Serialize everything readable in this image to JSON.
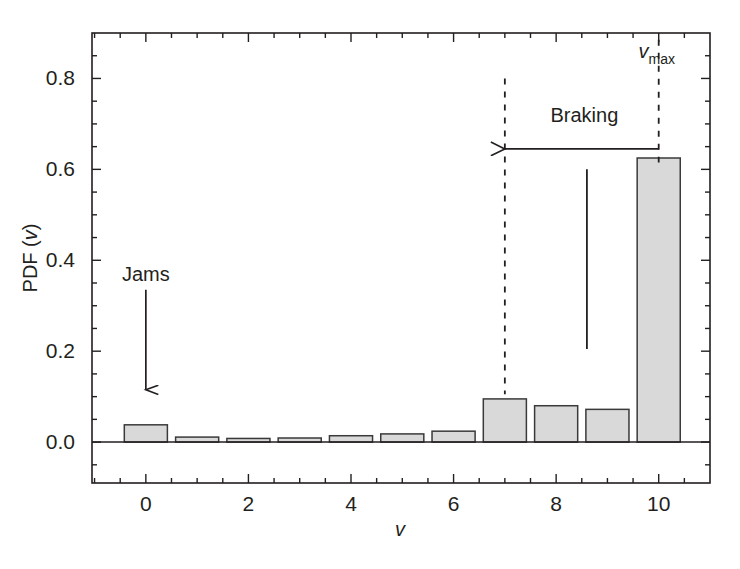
{
  "chart_data": {
    "type": "bar",
    "title": "",
    "subtitle": "",
    "xlabel": "v",
    "ylabel": "PDF (v)",
    "categories": [
      0,
      1,
      2,
      3,
      4,
      5,
      6,
      7,
      8,
      9,
      10
    ],
    "values": [
      0.038,
      0.011,
      0.008,
      0.009,
      0.014,
      0.018,
      0.024,
      0.095,
      0.08,
      0.072,
      0.625
    ],
    "series": [
      {
        "name": "PDF (v)",
        "values": [
          0.038,
          0.011,
          0.008,
          0.009,
          0.014,
          0.018,
          0.024,
          0.095,
          0.08,
          0.072,
          0.625
        ]
      }
    ],
    "xlim": [
      -1.05,
      11.0
    ],
    "ylim": [
      -0.09,
      0.9
    ],
    "xticks": [
      0,
      2,
      4,
      6,
      8,
      10
    ],
    "xtick_labels": [
      "0",
      "2",
      "4",
      "6",
      "8",
      "10"
    ],
    "xminor_step": 0.5,
    "yticks": [
      0.0,
      0.2,
      0.4,
      0.6,
      0.8
    ],
    "ytick_labels": [
      "0.0",
      "0.2",
      "0.4",
      "0.6",
      "0.8"
    ],
    "yminor_step": 0.05,
    "grid": false,
    "legend": "none",
    "bar_fill": "#d9d9d9",
    "bar_edge": "#3a3a3a",
    "bar_width": 0.84,
    "axis_color": "#231f20",
    "annotations": [
      {
        "name": "jams",
        "label": "Jams",
        "label_x": 0.0,
        "label_y": 0.355,
        "arrow_from": {
          "x": 0.0,
          "y": 0.335
        },
        "arrow_to": {
          "x": 0.0,
          "y": 0.115
        },
        "style": "solid-arrow-down"
      },
      {
        "name": "braking",
        "label": "Braking",
        "label_x": 8.55,
        "label_y": 0.705,
        "arrow_from": {
          "x": 10.0,
          "y": 0.645
        },
        "arrow_to": {
          "x": 7.0,
          "y": 0.645
        },
        "style": "solid-arrow-left"
      },
      {
        "name": "vmax",
        "label": "v",
        "sublabel": "max",
        "label_x": 10.0,
        "label_y": 0.845,
        "style": "text-italic-subscript"
      }
    ],
    "reference_lines": [
      {
        "name": "dashed-line-v7",
        "orientation": "vertical",
        "x": 7.0,
        "y_from": 0.105,
        "y_to": 0.8,
        "style": "dashed"
      },
      {
        "name": "dashed-line-vmax",
        "orientation": "vertical",
        "x": 10.0,
        "y_from": 0.615,
        "y_to": 0.885,
        "style": "dashed"
      },
      {
        "name": "solid-divider-line",
        "orientation": "vertical",
        "x": 8.6,
        "y_from": 0.205,
        "y_to": 0.6,
        "style": "solid"
      }
    ]
  }
}
